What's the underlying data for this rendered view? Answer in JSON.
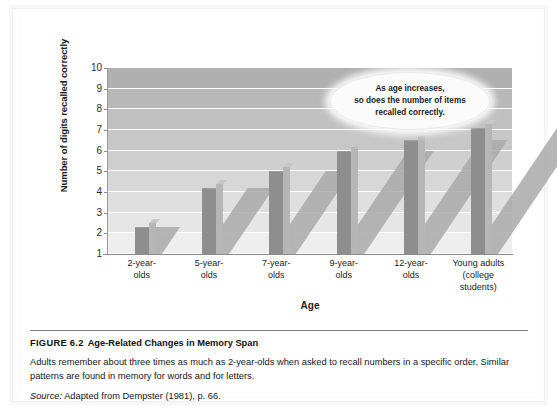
{
  "figure": {
    "number_label": "FIGURE 6.2",
    "title": "Age-Related Changes in Memory Span",
    "description": "Adults remember about three times as much as 2-year-olds when asked to recall numbers in a specific order. Similar patterns are found in memory for words and for letters.",
    "source_word": "Source:",
    "source_text": "Adapted from Dempster (1981), p. 66."
  },
  "callout": {
    "line1": "As age increases,",
    "line2": "so does  the number of items",
    "line3": "recalled correctly."
  },
  "chart_data": {
    "type": "bar",
    "title": "Age-Related Changes in Memory Span",
    "xlabel": "Age",
    "ylabel": "Number of digits recalled correctly",
    "categories": [
      "2-year-\nolds",
      "5-year-\nolds",
      "7-year-\nolds",
      "9-year-\nolds",
      "12-year-\nolds",
      "Young adults\n(college\nstudents)"
    ],
    "category_lines": [
      [
        "2-year-",
        "olds"
      ],
      [
        "5-year-",
        "olds"
      ],
      [
        "7-year-",
        "olds"
      ],
      [
        "9-year-",
        "olds"
      ],
      [
        "12-year-",
        "olds"
      ],
      [
        "Young adults",
        "(college",
        "students)"
      ]
    ],
    "values": [
      2.3,
      4.2,
      5.0,
      6.0,
      6.5,
      7.1
    ],
    "ylim": [
      1,
      10
    ],
    "yticks": [
      1,
      2,
      3,
      4,
      5,
      6,
      7,
      8,
      9,
      10
    ],
    "ytick_labels": [
      "1",
      "2",
      "3",
      "4",
      "5",
      "6",
      "7",
      "8",
      "9",
      "10"
    ],
    "grid": true,
    "legend": "none",
    "bar_color": "#8e8e8e",
    "plot_band_top_color": "#b0b0b0",
    "plot_band_bottom_color": "#eeeeee",
    "gridline_color": "#ffffff"
  }
}
